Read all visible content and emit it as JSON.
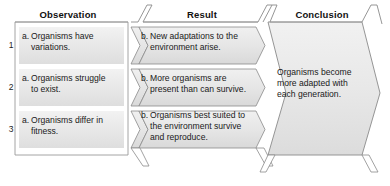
{
  "diagram": {
    "columns": [
      {
        "id": "observation",
        "label": "Observation"
      },
      {
        "id": "result",
        "label": "Result"
      },
      {
        "id": "conclusion",
        "label": "Conclusion"
      }
    ],
    "rows": [
      {
        "number": "1",
        "observation_marker": "a.",
        "observation_text": "Organisms have variations.",
        "result_marker": "b.",
        "result_text": "New adaptations to the environment arise."
      },
      {
        "number": "2",
        "observation_marker": "a.",
        "observation_text": "Organisms struggle to exist.",
        "result_marker": "b.",
        "result_text": "More organisms are present than can survive."
      },
      {
        "number": "3",
        "observation_marker": "a.",
        "observation_text": "Organisms differ in fitness.",
        "result_marker": "b.",
        "result_text": "Organisms best suited to the environment survive and reproduce."
      }
    ],
    "conclusion": {
      "text": "Organisms become more adapted with each generation."
    },
    "colors": {
      "page_background": "#ffffff",
      "cell_fill_light": "#ebebeb",
      "cell_fill_mid": "#e2e2e2",
      "chevron_fill": "#e6e6e6",
      "outline": "#8a8a8a",
      "text": "#1a1a1a"
    }
  }
}
